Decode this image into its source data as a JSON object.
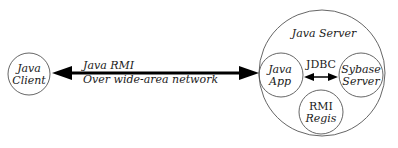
{
  "diagram": {
    "nodes": [
      {
        "id": "java-client",
        "lines": [
          "Java",
          "Client"
        ]
      },
      {
        "id": "java-server",
        "label": "Java Server"
      },
      {
        "id": "java-app",
        "lines": [
          "Java",
          "App"
        ]
      },
      {
        "id": "sybase-server",
        "lines": [
          "Sybase",
          "Server"
        ]
      },
      {
        "id": "rmi-registry",
        "lines": [
          "RMI",
          "Regis"
        ]
      }
    ],
    "edges": [
      {
        "id": "rmi-link",
        "from": "java-client",
        "to": "java-app",
        "label_lines": [
          "Java RMI",
          "Over wide-area network"
        ],
        "style": "bidirectional-thick"
      },
      {
        "id": "jdbc-link",
        "from": "java-app",
        "to": "sybase-server",
        "label": "JDBC",
        "style": "bidirectional"
      }
    ]
  },
  "colors": {
    "stroke": "#333333",
    "arrow": "#000000",
    "text": "#1a1a1a",
    "background": "#ffffff"
  }
}
